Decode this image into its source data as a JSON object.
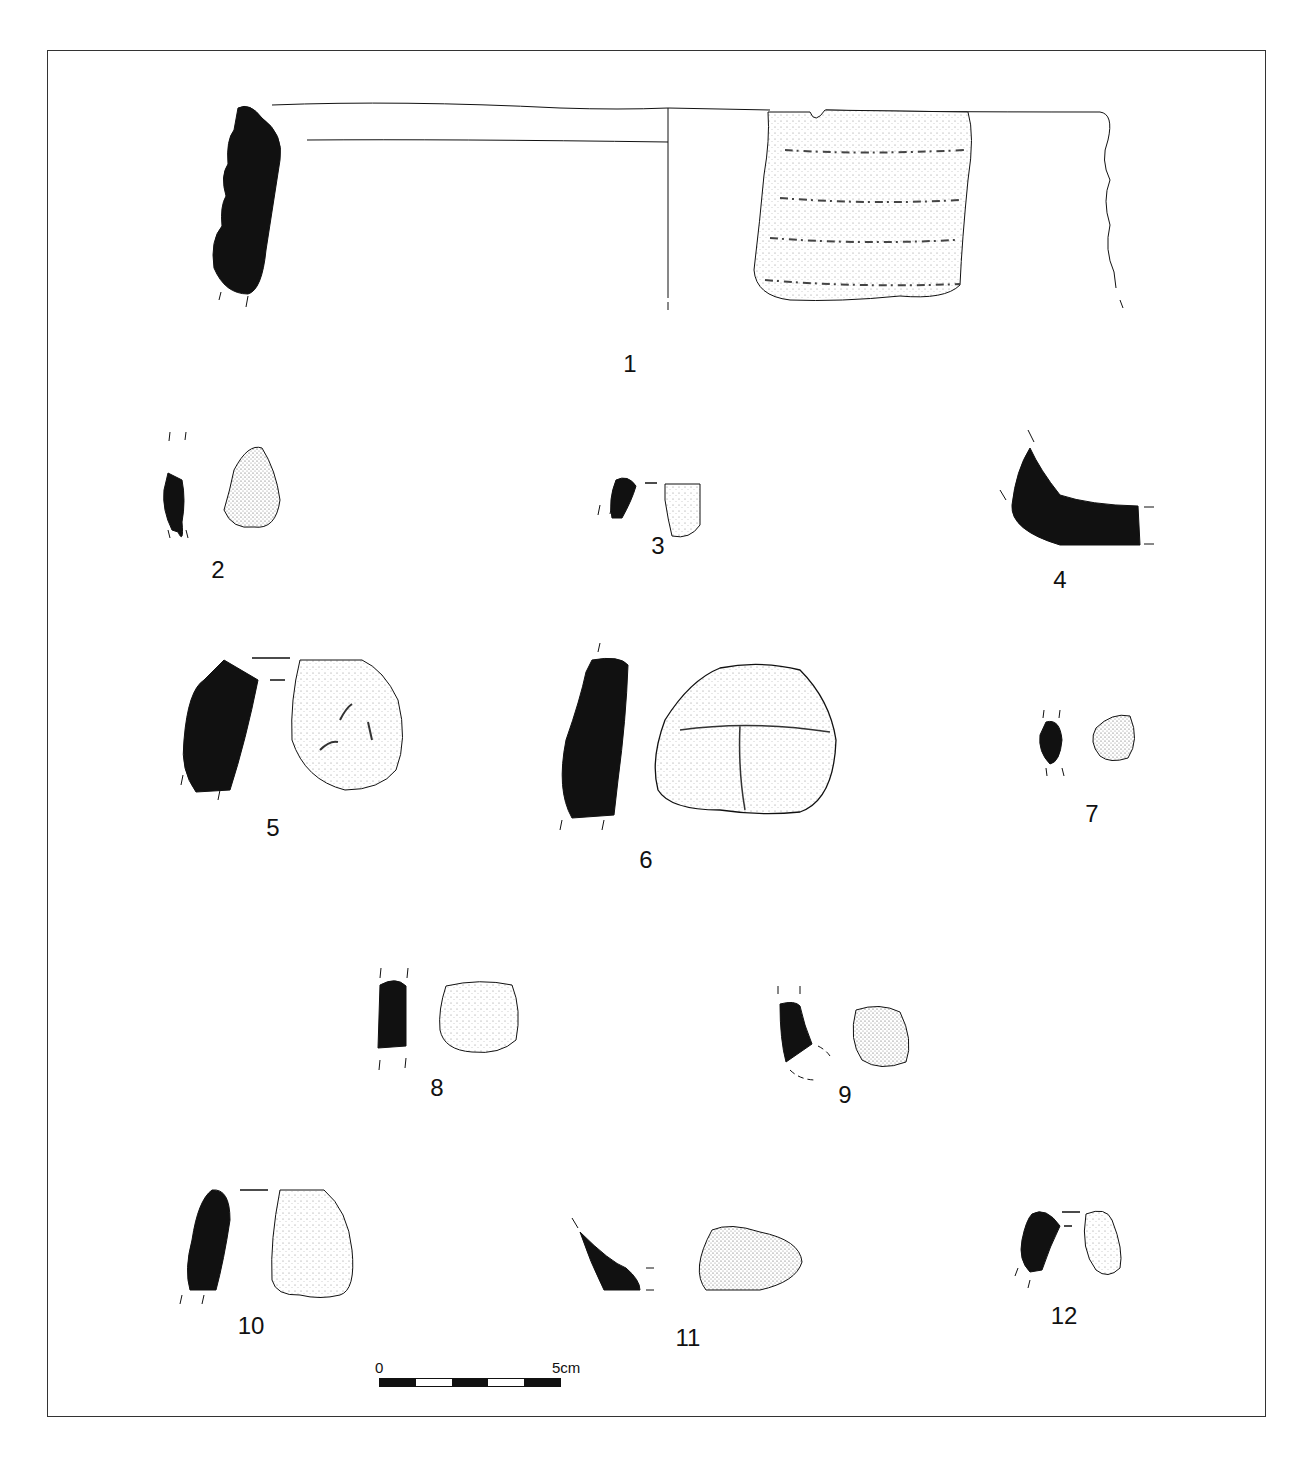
{
  "figure": {
    "type": "archaeological pottery sherd plate",
    "colors": {
      "ink": "#111111",
      "paper": "#ffffff",
      "frame": "#333333"
    },
    "sherds": [
      {
        "id": "1",
        "label": "1",
        "view": "profile + exterior (reconstructed rim)"
      },
      {
        "id": "2",
        "label": "2"
      },
      {
        "id": "3",
        "label": "3"
      },
      {
        "id": "4",
        "label": "4",
        "view": "base profile only"
      },
      {
        "id": "5",
        "label": "5"
      },
      {
        "id": "6",
        "label": "6"
      },
      {
        "id": "7",
        "label": "7"
      },
      {
        "id": "8",
        "label": "8"
      },
      {
        "id": "9",
        "label": "9"
      },
      {
        "id": "10",
        "label": "10"
      },
      {
        "id": "11",
        "label": "11"
      },
      {
        "id": "12",
        "label": "12"
      }
    ],
    "scale_bar": {
      "start_label": "0",
      "end_label": "5cm",
      "segments": 5
    }
  }
}
